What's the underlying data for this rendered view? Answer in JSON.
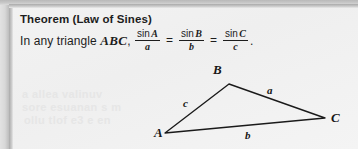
{
  "document": {
    "theorem": {
      "title": "Theorem (Law of Sines)",
      "lead_text": "In any triangle",
      "triangle_name": "ABC",
      "comma": ",",
      "fractions": [
        {
          "numerator_fn": "sin",
          "numerator_var": "A",
          "denominator": "a"
        },
        {
          "numerator_fn": "sin",
          "numerator_var": "B",
          "denominator": "b"
        },
        {
          "numerator_fn": "sin",
          "numerator_var": "C",
          "denominator": "c"
        }
      ],
      "equals_sign": "=",
      "period": "."
    },
    "bleed_through": {
      "line1": "a allea  valinuv",
      "line2": "sore esuanan   s m",
      "line3": "ollu  tlof e3 e en"
    }
  },
  "figure": {
    "caption": "",
    "vertices": [
      {
        "name": "B",
        "label": "B",
        "x": 216,
        "y": 29
      },
      {
        "name": "C",
        "label": "C",
        "x": 312,
        "y": 63
      },
      {
        "name": "A",
        "label": "A",
        "x": 152,
        "y": 78
      }
    ],
    "sides": [
      {
        "name": "a",
        "label": "a",
        "from": "B",
        "to": "C"
      },
      {
        "name": "b",
        "label": "b",
        "from": "A",
        "to": "C"
      },
      {
        "name": "c",
        "label": "c",
        "from": "A",
        "to": "B"
      }
    ],
    "colors": {
      "stroke": "#1a1a1a",
      "label": "#171717"
    }
  },
  "page": {
    "background": "#f1f1f1",
    "gutter": "#cfcfcf"
  }
}
